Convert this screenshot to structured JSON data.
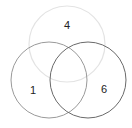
{
  "diagram": {
    "type": "venn",
    "sets": [
      {
        "id": "top",
        "label": "4",
        "color": "#e3e3e3",
        "cx": 67,
        "cy": 44,
        "r": 38,
        "label_x": 67,
        "label_y": 29
      },
      {
        "id": "left",
        "label": "1",
        "color": "#9a9a9a",
        "cx": 49,
        "cy": 80,
        "r": 38,
        "label_x": 33,
        "label_y": 94
      },
      {
        "id": "right",
        "label": "6",
        "color": "#6a6a6a",
        "cx": 88,
        "cy": 80,
        "r": 38,
        "label_x": 104,
        "label_y": 93
      }
    ]
  }
}
